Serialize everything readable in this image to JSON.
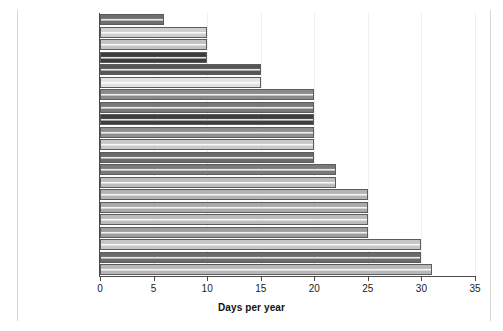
{
  "chart_data": {
    "type": "bar",
    "orientation": "horizontal",
    "title": "",
    "xlabel": "Days per year",
    "ylabel": "",
    "xlim": [
      0,
      35
    ],
    "ylim": null,
    "grid": "vertical dotted gridlines at x ticks",
    "legend": "none",
    "xticks": [
      "0",
      "5",
      "10",
      "15",
      "20",
      "25",
      "30",
      "35"
    ],
    "xtick_values": [
      0,
      5,
      10,
      15,
      20,
      25,
      30,
      35
    ],
    "categories": [
      "Mexico",
      "United States",
      "Japan",
      "Canada",
      "New Zealand",
      "Colombia",
      "UK",
      "Switzerland",
      "Netherlands",
      "Ireland",
      "Belgium",
      "Australia",
      "Spain",
      "Brazil",
      "Germany",
      "Sweden",
      "Norway",
      "France",
      "Finland",
      "Austria",
      "Denmark"
    ],
    "values": [
      6,
      10,
      10,
      10,
      15,
      15,
      20,
      20,
      20,
      20,
      20,
      20,
      22,
      22,
      25,
      25,
      25,
      25,
      30,
      30,
      31
    ],
    "bar_shades": [
      "#6f6f6f",
      "#cfcfcf",
      "#c3c3c3",
      "#3c3c3c",
      "#565656",
      "#e2e2e2",
      "#8a8a8a",
      "#787878",
      "#3f3f3f",
      "#8e8e8e",
      "#c9c9c9",
      "#6a6a6a",
      "#7a7a7a",
      "#bdbdbd",
      "#b3b3b3",
      "#a9a9a9",
      "#bbbbbb",
      "#9d9d9d",
      "#c6c6c6",
      "#6b6b6b",
      "#b8b8b8"
    ]
  },
  "axis": {
    "x_label_text": "Days per year"
  }
}
